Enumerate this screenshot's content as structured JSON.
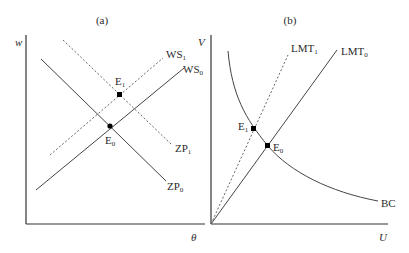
{
  "panels": [
    {
      "title": "(a)",
      "y_axis_label": "w",
      "x_axis_label": "θ",
      "curves": [
        {
          "name": "WS",
          "sub": "0",
          "style": "solid"
        },
        {
          "name": "WS",
          "sub": "1",
          "style": "dashed"
        },
        {
          "name": "ZP",
          "sub": "0",
          "style": "solid"
        },
        {
          "name": "ZP",
          "sub": "1",
          "style": "dashed"
        }
      ],
      "points": [
        {
          "name": "E",
          "sub": "0"
        },
        {
          "name": "E",
          "sub": "1"
        }
      ]
    },
    {
      "title": "(b)",
      "y_axis_label": "V",
      "x_axis_label": "U",
      "curves": [
        {
          "name": "LMT",
          "sub": "0",
          "style": "solid"
        },
        {
          "name": "LMT",
          "sub": "1",
          "style": "dashed"
        },
        {
          "name": "BC",
          "sub": "",
          "style": "solid"
        }
      ],
      "points": [
        {
          "name": "E",
          "sub": "0"
        },
        {
          "name": "E",
          "sub": "1"
        }
      ]
    }
  ]
}
